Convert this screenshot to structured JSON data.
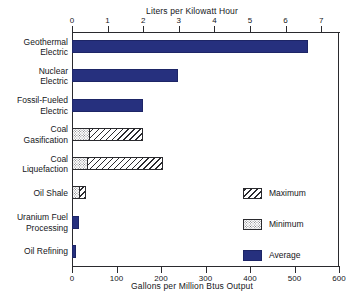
{
  "chart_data": {
    "type": "bar",
    "orientation": "horizontal",
    "title": "",
    "xlabel": "Gallons per Million Btus Output",
    "xlabel_top": "Liters per Kilowatt Hour",
    "ylabel": "",
    "xlim": [
      0,
      600
    ],
    "xticks": [
      0,
      100,
      200,
      300,
      400,
      500,
      600
    ],
    "xticklabels": [
      "0",
      "100",
      "200",
      "300",
      "400",
      "500",
      "600"
    ],
    "xlim_top": [
      0,
      7.5
    ],
    "xticks_top": [
      0,
      1,
      2,
      3,
      4,
      5,
      6,
      7
    ],
    "xticklabels_top": [
      "0",
      "1",
      "2",
      "3",
      "4",
      "5",
      "6",
      "7"
    ],
    "grid": false,
    "legend_position": "center-right",
    "categories": [
      "Geothermal\nElectric",
      "Nuclear\nElectric",
      "Fossil-Fueled\nElectric",
      "Coal\nGasification",
      "Coal\nLiquefaction",
      "Oil Shale",
      "Uranium Fuel\nProcessing",
      "Oil Refining"
    ],
    "series": [
      {
        "name": "Maximum",
        "style": "hatched",
        "values": [
          null,
          null,
          null,
          160,
          205,
          32,
          null,
          null
        ]
      },
      {
        "name": "Minimum",
        "style": "dotted",
        "values": [
          null,
          null,
          null,
          40,
          36,
          18,
          null,
          null
        ]
      },
      {
        "name": "Average",
        "style": "solid",
        "color": "#26307e",
        "values": [
          530,
          239,
          160,
          null,
          null,
          null,
          16,
          9
        ]
      }
    ]
  },
  "legend": {
    "items": [
      {
        "label": "Maximum",
        "swatch": "hatched-swatch"
      },
      {
        "label": "Minimum",
        "swatch": "dotted-swatch"
      },
      {
        "label": "Average",
        "swatch": "solid-navy-swatch"
      }
    ]
  },
  "colors": {
    "average": "#26307e",
    "axis": "#2a2a2e",
    "text": "#15161a",
    "background": "#ffffff"
  }
}
